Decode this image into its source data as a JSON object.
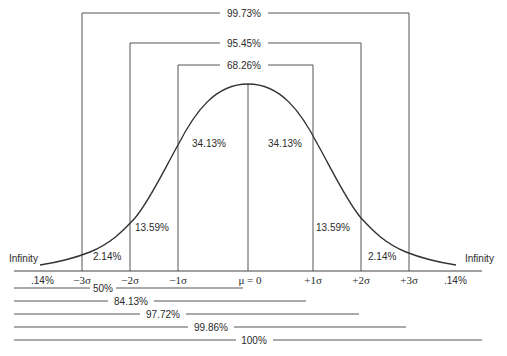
{
  "diagram": {
    "type": "normal-distribution",
    "intervals": [
      {
        "label": "68.26%",
        "left": "-1σ",
        "right": "+1σ"
      },
      {
        "label": "95.45%",
        "left": "-2σ",
        "right": "+2σ"
      },
      {
        "label": "99.73%",
        "left": "-3σ",
        "right": "+3σ"
      }
    ],
    "region_labels": {
      "left_inner": "34.13%",
      "right_inner": "34.13%",
      "left_mid": "13.59%",
      "right_mid": "13.59%",
      "left_outer": "2.14%",
      "right_outer": "2.14%",
      "left_tail": ".14%",
      "right_tail": ".14%"
    },
    "tails": {
      "left": "Infinity",
      "right": "Infinity"
    },
    "axis_ticks": [
      "−3σ",
      "−2σ",
      "−1σ",
      "μ = 0",
      "+1σ",
      "+2σ",
      "+3σ"
    ],
    "cumulative": [
      {
        "label": "50%",
        "upto": "μ"
      },
      {
        "label": "84.13%",
        "upto": "+1σ"
      },
      {
        "label": "97.72%",
        "upto": "+2σ"
      },
      {
        "label": "99.86%",
        "upto": "+3σ"
      },
      {
        "label": "100%",
        "upto": "Infinity"
      }
    ]
  },
  "colors": {
    "line": "#555555",
    "curve": "#333333",
    "text": "#2a2a2a",
    "background": "#ffffff"
  }
}
